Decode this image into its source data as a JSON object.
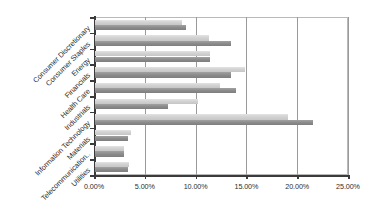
{
  "chart_data": {
    "type": "bar",
    "orientation": "horizontal",
    "title": "",
    "subtitle": "",
    "xlabel": "",
    "ylabel": "",
    "xlim": [
      0,
      25
    ],
    "xticks": [
      0,
      5,
      10,
      15,
      20,
      25
    ],
    "xticklabels": [
      "0.00%",
      "5.00%",
      "10.00%",
      "15.00%",
      "20.00%",
      "25.00%"
    ],
    "grid": true,
    "grid_axis": "x",
    "legend": "none",
    "categories": [
      "Consumer Discretionary",
      "Consumer Staples",
      "Energy",
      "Financials",
      "Health Care",
      "Industrials",
      "Information Technology",
      "Materials",
      "Telecommunication..",
      "Utilities"
    ],
    "series": [
      {
        "name": "Series 1",
        "color": "#d2d2d2",
        "values": [
          8.6,
          11.2,
          11.3,
          14.8,
          12.3,
          10.1,
          19.0,
          3.5,
          2.9,
          3.3
        ]
      },
      {
        "name": "Series 2",
        "color": "#8d8d8d",
        "values": [
          9.0,
          13.4,
          11.3,
          13.4,
          13.9,
          7.2,
          21.5,
          3.2,
          2.9,
          3.2
        ]
      }
    ]
  },
  "axis": {
    "tick_0": "0.00%",
    "tick_1": "5.00%",
    "tick_2": "10.00%",
    "tick_3": "15.00%",
    "tick_4": "20.00%",
    "tick_5": "25.00%"
  },
  "categories": {
    "c0": "Consumer Discretionary",
    "c1": "Consumer Staples",
    "c2": "Energy",
    "c3": "Financials",
    "c4": "Health Care",
    "c5": "Industrials",
    "c6": "Information Technology",
    "c7": "Materials",
    "c8": "Telecommunication..",
    "c9": "Utilities"
  }
}
